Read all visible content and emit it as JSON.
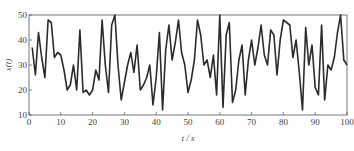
{
  "chart_data": {
    "type": "line",
    "title": "",
    "xlabel": "t / s",
    "ylabel": "x(t)",
    "xlim": [
      0,
      100
    ],
    "ylim": [
      10,
      50
    ],
    "xticks": [
      0,
      10,
      20,
      30,
      40,
      50,
      60,
      70,
      80,
      90,
      100
    ],
    "yticks": [
      10,
      20,
      30,
      40,
      50
    ],
    "grid": false,
    "legend": null,
    "line_color": "#2b2b2b",
    "series": [
      {
        "name": "x(t)",
        "x": [
          1,
          2,
          3,
          4,
          5,
          6,
          7,
          8,
          9,
          10,
          11,
          12,
          13,
          14,
          15,
          16,
          17,
          18,
          19,
          20,
          21,
          22,
          23,
          24,
          25,
          26,
          27,
          28,
          29,
          30,
          31,
          32,
          33,
          34,
          35,
          36,
          37,
          38,
          39,
          40,
          41,
          42,
          43,
          44,
          45,
          46,
          47,
          48,
          49,
          50,
          51,
          52,
          53,
          54,
          55,
          56,
          57,
          58,
          59,
          60,
          61,
          62,
          63,
          64,
          65,
          66,
          67,
          68,
          69,
          70,
          71,
          72,
          73,
          74,
          75,
          76,
          77,
          78,
          79,
          80,
          81,
          82,
          83,
          84,
          85,
          86,
          87,
          88,
          89,
          90,
          91,
          92,
          93,
          94,
          95,
          96,
          97,
          98,
          99,
          100
        ],
        "values": [
          37,
          26,
          43,
          33,
          25,
          48,
          47,
          33,
          35,
          34,
          28,
          20,
          22,
          30,
          20,
          44,
          19,
          20,
          18,
          20,
          28,
          24,
          48,
          30,
          19,
          46,
          50,
          30,
          16,
          23,
          30,
          35,
          27,
          38,
          20,
          22,
          25,
          30,
          14,
          25,
          43,
          12,
          36,
          46,
          32,
          39,
          48,
          35,
          30,
          19,
          24,
          32,
          48,
          42,
          30,
          32,
          25,
          34,
          18,
          50,
          13,
          42,
          47,
          15,
          20,
          32,
          38,
          18,
          32,
          40,
          30,
          37,
          46,
          34,
          30,
          44,
          42,
          26,
          40,
          48,
          47,
          46,
          33,
          40,
          27,
          12,
          45,
          30,
          38,
          21,
          18,
          46,
          16,
          30,
          28,
          33,
          43,
          50,
          32,
          30
        ]
      }
    ]
  },
  "axes": {
    "xlabel_italic": "t",
    "xlabel_unit": " / s",
    "ylabel_text": "x(t)"
  }
}
